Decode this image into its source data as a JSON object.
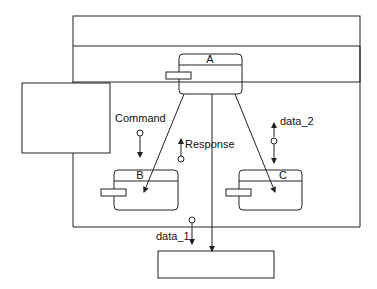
{
  "diagram": {
    "modules": {
      "a": {
        "label": "A"
      },
      "b": {
        "label": "B"
      },
      "c": {
        "label": "C"
      }
    },
    "couples": {
      "command": {
        "label": "Command",
        "direction": "down"
      },
      "response": {
        "label": "Response",
        "direction": "up"
      },
      "data_2": {
        "label": "data_2",
        "direction": "up-down"
      },
      "data_1": {
        "label": "data_1",
        "direction": "down"
      }
    },
    "colors": {
      "line": "#222222",
      "background": "#ffffff"
    }
  }
}
